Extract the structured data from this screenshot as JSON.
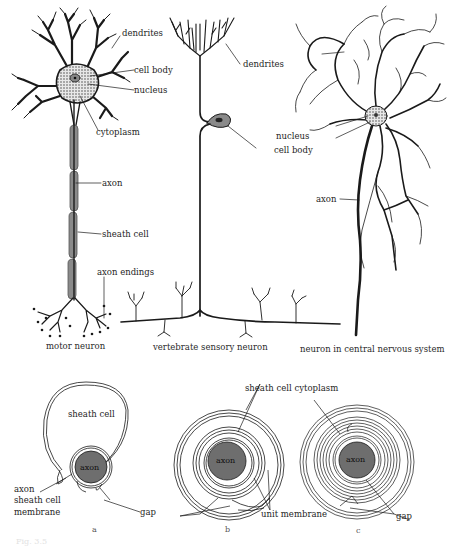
{
  "figure": {
    "type": "biology illustration",
    "caption_faded": "Fig. 3.5"
  },
  "top_panel": {
    "neurons": [
      {
        "name": "motor neuron",
        "caption": "motor neuron",
        "labels": {
          "dendrites": "dendrites",
          "cell_body": "cell body",
          "nucleus": "nucleus",
          "cytoplasm": "cytoplasm",
          "axon": "axon",
          "sheath_cell": "sheath cell",
          "axon_endings": "axon endings"
        }
      },
      {
        "name": "vertebrate sensory neuron",
        "caption": "vertebrate sensory neuron",
        "labels": {
          "dendrites": "dendrites",
          "nucleus": "nucleus",
          "cell_body": "cell body"
        }
      },
      {
        "name": "neuron in central nervous system",
        "caption": "neuron in central nervous system",
        "labels": {
          "axon": "axon"
        }
      }
    ]
  },
  "bottom_panel": {
    "stages": [
      {
        "letter": "a",
        "labels": {
          "sheath_cell": "sheath cell",
          "axon": "axon",
          "axon_sheath_membrane_line1": "axon",
          "axon_sheath_membrane_line2": "sheath cell",
          "axon_sheath_membrane_line3": "membrane",
          "gap": "gap"
        }
      },
      {
        "letter": "b",
        "labels": {
          "sheath_cell_cytoplasm": "sheath cell cytoplasm",
          "axon": "axon",
          "unit_membrane": "unit membrane"
        }
      },
      {
        "letter": "c",
        "labels": {
          "axon": "axon",
          "gap": "gap"
        }
      }
    ]
  },
  "colors": {
    "ink": "#1a1a1a",
    "axon_fill": "#6e6e6e",
    "sheath_fill": "#8a8a8a",
    "background": "#ffffff"
  }
}
